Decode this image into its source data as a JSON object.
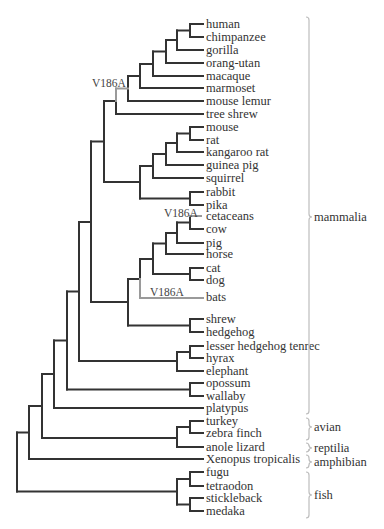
{
  "figure": {
    "type": "phylogenetic-tree",
    "colors": {
      "branch": "#333333",
      "highlight": "#9a9a9a",
      "bracket": "#bdbdbd",
      "text": "#333333"
    },
    "leaf_x": 206,
    "leaves": [
      {
        "label": "human",
        "y": 24
      },
      {
        "label": "chimpanzee",
        "y": 37
      },
      {
        "label": "gorilla",
        "y": 50
      },
      {
        "label": "orang-utan",
        "y": 63
      },
      {
        "label": "macaque",
        "y": 76
      },
      {
        "label": "marmoset",
        "y": 88
      },
      {
        "label": "mouse lemur",
        "y": 101
      },
      {
        "label": "tree shrew",
        "y": 114
      },
      {
        "label": "mouse",
        "y": 127
      },
      {
        "label": "rat",
        "y": 140
      },
      {
        "label": "kangaroo rat",
        "y": 152
      },
      {
        "label": "guinea pig",
        "y": 165
      },
      {
        "label": "squirrel",
        "y": 178
      },
      {
        "label": "rabbit",
        "y": 192
      },
      {
        "label": "pika",
        "y": 205
      },
      {
        "label": "cetaceans",
        "y": 216
      },
      {
        "label": "cow",
        "y": 229
      },
      {
        "label": "pig",
        "y": 243
      },
      {
        "label": "horse",
        "y": 254
      },
      {
        "label": "cat",
        "y": 268
      },
      {
        "label": "dog",
        "y": 280
      },
      {
        "label": "bats",
        "y": 297
      },
      {
        "label": "shrew",
        "y": 319
      },
      {
        "label": "hedgehog",
        "y": 332
      },
      {
        "label": "lesser hedgehog tenrec",
        "y": 346
      },
      {
        "label": "hyrax",
        "y": 358
      },
      {
        "label": "elephant",
        "y": 371
      },
      {
        "label": "opossum",
        "y": 383
      },
      {
        "label": "wallaby",
        "y": 396
      },
      {
        "label": "platypus",
        "y": 408
      },
      {
        "label": "turkey",
        "y": 421
      },
      {
        "label": "zebra finch",
        "y": 433
      },
      {
        "label": "anole lizard",
        "y": 447
      },
      {
        "label": "Xenopus tropicalis",
        "y": 459
      },
      {
        "label": "fugu",
        "y": 472
      },
      {
        "label": "tetraodon",
        "y": 486
      },
      {
        "label": "stickleback",
        "y": 498
      },
      {
        "label": "medaka",
        "y": 511
      }
    ],
    "mutations": [
      {
        "label": "V186A",
        "x": 92,
        "y": 87,
        "branch": "primates + mouse lemur"
      },
      {
        "label": "V186A",
        "x": 164,
        "y": 217,
        "branch": "cetaceans"
      },
      {
        "label": "V186A",
        "x": 150,
        "y": 296,
        "branch": "bats"
      }
    ],
    "groups": [
      {
        "label": "mammalia",
        "top": 17,
        "bottom": 414,
        "mid": 217
      },
      {
        "label": "avian",
        "top": 418,
        "bottom": 440,
        "mid": 427
      },
      {
        "label": "reptilia",
        "top": 443,
        "bottom": 452,
        "mid": 448
      },
      {
        "label": "amphibian",
        "top": 455,
        "bottom": 468,
        "mid": 462
      },
      {
        "label": "fish",
        "top": 472,
        "bottom": 518,
        "mid": 495
      }
    ],
    "bracket_x": 309,
    "segments": [
      [
        190,
        24,
        203,
        24
      ],
      [
        190,
        37,
        203,
        37
      ],
      [
        190,
        24,
        190,
        37
      ],
      [
        177,
        30.5,
        190,
        30.5
      ],
      [
        177,
        50,
        203,
        50
      ],
      [
        177,
        30.5,
        177,
        50
      ],
      [
        166,
        40,
        177,
        40
      ],
      [
        166,
        63,
        203,
        63
      ],
      [
        166,
        40,
        166,
        63
      ],
      [
        153,
        51.5,
        166,
        51.5
      ],
      [
        153,
        76,
        203,
        76
      ],
      [
        153,
        51.5,
        153,
        76
      ],
      [
        140,
        64,
        153,
        64
      ],
      [
        140,
        88,
        203,
        88
      ],
      [
        140,
        64,
        140,
        88
      ],
      [
        128,
        76,
        140,
        76
      ],
      [
        128,
        101,
        203,
        101
      ],
      [
        128,
        76,
        128,
        101
      ],
      [
        116,
        101,
        116,
        114
      ],
      [
        116,
        114,
        203,
        114
      ],
      [
        104,
        101,
        116,
        101
      ],
      [
        190,
        127,
        203,
        127
      ],
      [
        190,
        140,
        203,
        140
      ],
      [
        190,
        127,
        190,
        140
      ],
      [
        177,
        133.5,
        190,
        133.5
      ],
      [
        177,
        152,
        203,
        152
      ],
      [
        177,
        133.5,
        177,
        152
      ],
      [
        166,
        143,
        177,
        143
      ],
      [
        166,
        165,
        203,
        165
      ],
      [
        166,
        143,
        166,
        165
      ],
      [
        153,
        154,
        166,
        154
      ],
      [
        153,
        178,
        203,
        178
      ],
      [
        153,
        154,
        153,
        178
      ],
      [
        190,
        192,
        203,
        192
      ],
      [
        190,
        205,
        203,
        205
      ],
      [
        190,
        192,
        190,
        205
      ],
      [
        140,
        166,
        153,
        166
      ],
      [
        140,
        198.5,
        190,
        198.5
      ],
      [
        140,
        166,
        140,
        198.5
      ],
      [
        104,
        182,
        140,
        182
      ],
      [
        104,
        101,
        104,
        182
      ],
      [
        91,
        141.5,
        104,
        141.5
      ],
      [
        91,
        302,
        128,
        302
      ],
      [
        91,
        141.5,
        91,
        302
      ],
      [
        190,
        229,
        203,
        229
      ],
      [
        190,
        216,
        190,
        229
      ],
      [
        177,
        222.5,
        190,
        222.5
      ],
      [
        177,
        243,
        203,
        243
      ],
      [
        177,
        222.5,
        177,
        243
      ],
      [
        166,
        233,
        177,
        233
      ],
      [
        166,
        254,
        203,
        254
      ],
      [
        166,
        233,
        166,
        254
      ],
      [
        190,
        268,
        203,
        268
      ],
      [
        190,
        280,
        203,
        280
      ],
      [
        190,
        268,
        190,
        280
      ],
      [
        153,
        243.5,
        166,
        243.5
      ],
      [
        153,
        274,
        190,
        274
      ],
      [
        153,
        243.5,
        153,
        274
      ],
      [
        140,
        259,
        153,
        259
      ],
      [
        140,
        259,
        140,
        279
      ],
      [
        128,
        279,
        140,
        279
      ],
      [
        128,
        325.5,
        190,
        325.5
      ],
      [
        128,
        279,
        128,
        325.5
      ],
      [
        190,
        319,
        203,
        319
      ],
      [
        190,
        332,
        203,
        332
      ],
      [
        190,
        319,
        190,
        332
      ],
      [
        79,
        222,
        91,
        222
      ],
      [
        79,
        361,
        177,
        361
      ],
      [
        79,
        222,
        79,
        361
      ],
      [
        190,
        346,
        203,
        346
      ],
      [
        190,
        358,
        203,
        358
      ],
      [
        190,
        346,
        190,
        358
      ],
      [
        177,
        352,
        190,
        352
      ],
      [
        177,
        371,
        203,
        371
      ],
      [
        177,
        352,
        177,
        371
      ],
      [
        67,
        291.5,
        79,
        291.5
      ],
      [
        67,
        389.5,
        190,
        389.5
      ],
      [
        67,
        291.5,
        67,
        389.5
      ],
      [
        190,
        383,
        203,
        383
      ],
      [
        190,
        396,
        203,
        396
      ],
      [
        190,
        383,
        190,
        396
      ],
      [
        54,
        340.5,
        67,
        340.5
      ],
      [
        54,
        408,
        203,
        408
      ],
      [
        54,
        340.5,
        54,
        408
      ],
      [
        42,
        374,
        54,
        374
      ],
      [
        42,
        438,
        177,
        438
      ],
      [
        42,
        374,
        42,
        438
      ],
      [
        190,
        421,
        203,
        421
      ],
      [
        190,
        433,
        203,
        433
      ],
      [
        190,
        421,
        190,
        433
      ],
      [
        177,
        427,
        190,
        427
      ],
      [
        177,
        447,
        203,
        447
      ],
      [
        177,
        427,
        177,
        447
      ],
      [
        29,
        406,
        42,
        406
      ],
      [
        29,
        459,
        203,
        459
      ],
      [
        29,
        406,
        29,
        459
      ],
      [
        17,
        432.5,
        29,
        432.5
      ],
      [
        17,
        491.5,
        177,
        491.5
      ],
      [
        17,
        432.5,
        17,
        491.5
      ],
      [
        190,
        472,
        203,
        472
      ],
      [
        190,
        486,
        203,
        486
      ],
      [
        190,
        472,
        190,
        486
      ],
      [
        190,
        498,
        203,
        498
      ],
      [
        190,
        511,
        203,
        511
      ],
      [
        190,
        498,
        190,
        511
      ],
      [
        177,
        479,
        190,
        479
      ],
      [
        177,
        504.5,
        190,
        504.5
      ],
      [
        177,
        479,
        177,
        504.5
      ]
    ],
    "highlight_segments": [
      [
        116,
        88.5,
        128,
        88.5
      ],
      [
        116,
        88.5,
        116,
        101
      ],
      [
        190,
        216,
        201,
        216
      ],
      [
        140,
        279,
        140,
        298
      ],
      [
        140,
        298,
        203,
        298
      ]
    ]
  }
}
